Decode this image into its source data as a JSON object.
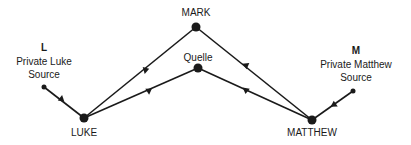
{
  "diagram": {
    "nodes": {
      "mark": {
        "label": "MARK",
        "x": 196,
        "y": 27
      },
      "quelle": {
        "label": "Quelle",
        "x": 198,
        "y": 68
      },
      "l": {
        "label": "L",
        "sublabel_line1": "Private Luke",
        "sublabel_line2": "Source",
        "x": 44,
        "y": 87
      },
      "luke": {
        "label": "LUKE",
        "x": 84,
        "y": 118
      },
      "matthew": {
        "label": "MATTHEW",
        "x": 312,
        "y": 120
      },
      "m": {
        "label": "M",
        "sublabel_line1": "Private Matthew",
        "sublabel_line2": "Source",
        "x": 353,
        "y": 91
      }
    },
    "edges": [
      {
        "from": "mark",
        "to": "luke"
      },
      {
        "from": "mark",
        "to": "matthew"
      },
      {
        "from": "quelle",
        "to": "luke"
      },
      {
        "from": "quelle",
        "to": "matthew"
      },
      {
        "from": "l",
        "to": "luke"
      },
      {
        "from": "m",
        "to": "matthew"
      }
    ],
    "colors": {
      "line": "#1a1a1a",
      "background": "#ffffff"
    }
  }
}
